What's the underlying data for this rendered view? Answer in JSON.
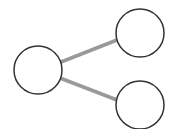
{
  "diagram": {
    "type": "tree",
    "background": "#ffffff",
    "node_stroke": "#333333",
    "node_fill": "#ffffff",
    "edge_color": "#999999",
    "nodes": [
      {
        "id": "root",
        "cx": 38,
        "cy": 70,
        "r": 24,
        "label": ""
      },
      {
        "id": "child-top",
        "cx": 140,
        "cy": 33,
        "r": 24,
        "label": ""
      },
      {
        "id": "child-bottom",
        "cx": 140,
        "cy": 105,
        "r": 24,
        "label": ""
      }
    ],
    "edges": [
      {
        "from": "root",
        "to": "child-top",
        "x1": 61,
        "y1": 62,
        "x2": 117,
        "y2": 40
      },
      {
        "from": "root",
        "to": "child-bottom",
        "x1": 60,
        "y1": 78,
        "x2": 117,
        "y2": 100
      }
    ]
  }
}
